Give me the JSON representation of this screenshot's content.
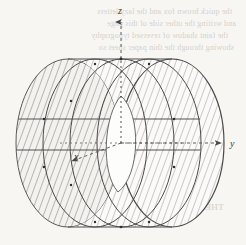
{
  "figure": {
    "canvas": {
      "width": 246,
      "height": 245
    },
    "background_color": "#f7f6f3",
    "ink_color": "#4a4a4a",
    "hatch_color": "#8e8e8e",
    "axis_color": "#555555"
  },
  "axes": [
    {
      "name": "z-axis",
      "label": "z",
      "label_x": 120,
      "label_y": 14,
      "style": "dashed",
      "arrow": "up",
      "arrow_tip_x": 121,
      "arrow_tip_y": 20
    },
    {
      "name": "y-axis",
      "label": "y",
      "label_x": 232,
      "label_y": 145,
      "style": "dashed",
      "arrow": "right",
      "arrow_tip_x": 224,
      "arrow_tip_y": 143
    },
    {
      "name": "x-axis",
      "label": "x",
      "label_x": 76,
      "label_y": 159,
      "style": "dashed",
      "arrow": "lower-left",
      "arrow_tip_x": 70,
      "arrow_tip_y": 163
    }
  ],
  "origin": {
    "x": 121,
    "y": 143
  },
  "cylinder": {
    "description": "hatched circular cylinder drawn in oblique projection",
    "hatching": "diagonal line fill",
    "rings_count": 4,
    "inner_hole": "visible white lens-shaped opening at near end cap",
    "axis_line": "dotted center line along cylinder axis"
  },
  "bleed_through": {
    "note": "faint reversed text showing through the paper from the other side",
    "top_lines": [
      "the quick brown fox and the lazy letters",
      "and writing the other side of this page",
      "the faint shadow of reversed typography",
      "showing through the thin paper sheet so"
    ],
    "bottom_lines": [
      "THE FIGURE"
    ]
  }
}
